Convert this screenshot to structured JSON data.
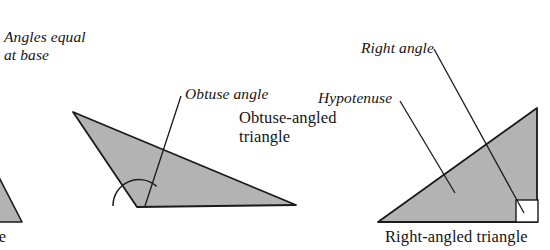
{
  "figure": {
    "kind": "geometry-illustration",
    "background_color": "#ffffff",
    "fill_color": "#b3b3b3",
    "stroke_color": "#1a1a1a",
    "annotations": {
      "angles_equal_at_base": "Angles equal\nat base",
      "obtuse_angle": "Obtuse angle",
      "right_angle": "Right angle",
      "hypotenuse": "Hypotenuse"
    },
    "captions": {
      "obtuse_triangle": "Obtuse-angled\ntriangle",
      "right_triangle": "Right-angled triangle",
      "isosceles_triangle_partial": "le"
    },
    "shapes": {
      "isosceles_triangle": {
        "name": "isosceles-triangle",
        "cropped": true,
        "points": "-36,222 -14,152 22,222"
      },
      "obtuse_triangle": {
        "name": "obtuse-triangle",
        "points": "73,112 137,207 296,205"
      },
      "right_triangle": {
        "name": "right-triangle",
        "points": "378,222 537,108 537,222"
      },
      "right_angle_marker": {
        "name": "right-angle-marker",
        "points": "516,222 516,200 538,200"
      },
      "obtuse_angle_arc": {
        "name": "obtuse-angle-arc",
        "center_x": 139,
        "center_y": 206,
        "radius": 26
      }
    },
    "leader_lines": {
      "obtuse_angle": "181,96 145,206",
      "right_angle": "434,49 524,213",
      "hypotenuse": "400,101 455,193",
      "isosceles_left": "-2,172 -20,186"
    }
  }
}
